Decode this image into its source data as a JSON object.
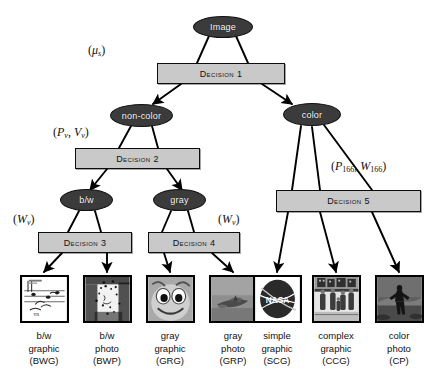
{
  "figure": {
    "type": "decision-tree-diagram",
    "colors": {
      "node_fill": "#3b3b3b",
      "node_text": "#ffffff",
      "box_fill": "#c9c9c9",
      "box_text": "#111111",
      "stroke": "#000000",
      "background": "#ffffff"
    }
  },
  "nodes": {
    "root": {
      "label": "Image"
    },
    "non_color": {
      "label": "non-color"
    },
    "color": {
      "label": "color"
    },
    "bw": {
      "label": "b/w"
    },
    "gray": {
      "label": "gray"
    }
  },
  "decisions": [
    {
      "id": "d1",
      "label": "Decision 1"
    },
    {
      "id": "d2",
      "label": "Decision 2"
    },
    {
      "id": "d3",
      "label": "Decision 3"
    },
    {
      "id": "d4",
      "label": "Decision 4"
    },
    {
      "id": "d5",
      "label": "Decision 5"
    }
  ],
  "feature_labels": [
    {
      "id": "f1",
      "for": "Decision 1",
      "vars": [
        {
          "sym": "μ",
          "sub": "s"
        }
      ]
    },
    {
      "id": "f2",
      "for": "Decision 2",
      "vars": [
        {
          "sym": "P",
          "sub": "v"
        },
        {
          "sym": "V",
          "sub": "v"
        }
      ]
    },
    {
      "id": "f3",
      "for": "Decision 3",
      "vars": [
        {
          "sym": "W",
          "sub": "v"
        }
      ]
    },
    {
      "id": "f4",
      "for": "Decision 4",
      "vars": [
        {
          "sym": "W",
          "sub": "v"
        }
      ]
    },
    {
      "id": "f5",
      "for": "Decision 5",
      "vars": [
        {
          "sym": "P",
          "sub": "166"
        },
        {
          "sym": "W",
          "sub": "166"
        }
      ]
    }
  ],
  "leaves": [
    {
      "id": "bwg",
      "line1": "b/w",
      "line2": "graphic",
      "code": "(BWG)",
      "thumb": "bw-graphic-sheet-music"
    },
    {
      "id": "bwp",
      "line1": "b/w",
      "line2": "photo",
      "code": "(BWP)",
      "thumb": "bw-photo-halftone-face"
    },
    {
      "id": "grg",
      "line1": "gray",
      "line2": "graphic",
      "code": "(GRG)",
      "thumb": "gray-graphic-cartoon-face"
    },
    {
      "id": "grp",
      "line1": "gray",
      "line2": "photo",
      "code": "(GRP)",
      "thumb": "gray-photo-airplane"
    },
    {
      "id": "scg",
      "line1": "simple",
      "line2": "graphic",
      "code": "(SCG)",
      "thumb": "simple-graphic-nasa-logo"
    },
    {
      "id": "ccg",
      "line1": "complex",
      "line2": "graphic",
      "code": "(CCG)",
      "thumb": "complex-graphic-street-scene"
    },
    {
      "id": "cp",
      "line1": "color",
      "line2": "photo",
      "code": "(CP)",
      "thumb": "color-photo-person-outdoors"
    }
  ],
  "edges": [
    {
      "from": "Image",
      "to": "Decision 1"
    },
    {
      "from": "Decision 1",
      "to": "non-color"
    },
    {
      "from": "Decision 1",
      "to": "color"
    },
    {
      "from": "non-color",
      "to": "Decision 2"
    },
    {
      "from": "Decision 2",
      "to": "b/w"
    },
    {
      "from": "Decision 2",
      "to": "gray"
    },
    {
      "from": "b/w",
      "to": "Decision 3"
    },
    {
      "from": "gray",
      "to": "Decision 4"
    },
    {
      "from": "Decision 3",
      "to": "(BWG)"
    },
    {
      "from": "Decision 3",
      "to": "(BWP)"
    },
    {
      "from": "Decision 4",
      "to": "(GRG)"
    },
    {
      "from": "Decision 4",
      "to": "(GRP)"
    },
    {
      "from": "color",
      "to": "Decision 5"
    },
    {
      "from": "Decision 5",
      "to": "(SCG)"
    },
    {
      "from": "Decision 5",
      "to": "(CCG)"
    },
    {
      "from": "Decision 5",
      "to": "(CP)"
    }
  ]
}
